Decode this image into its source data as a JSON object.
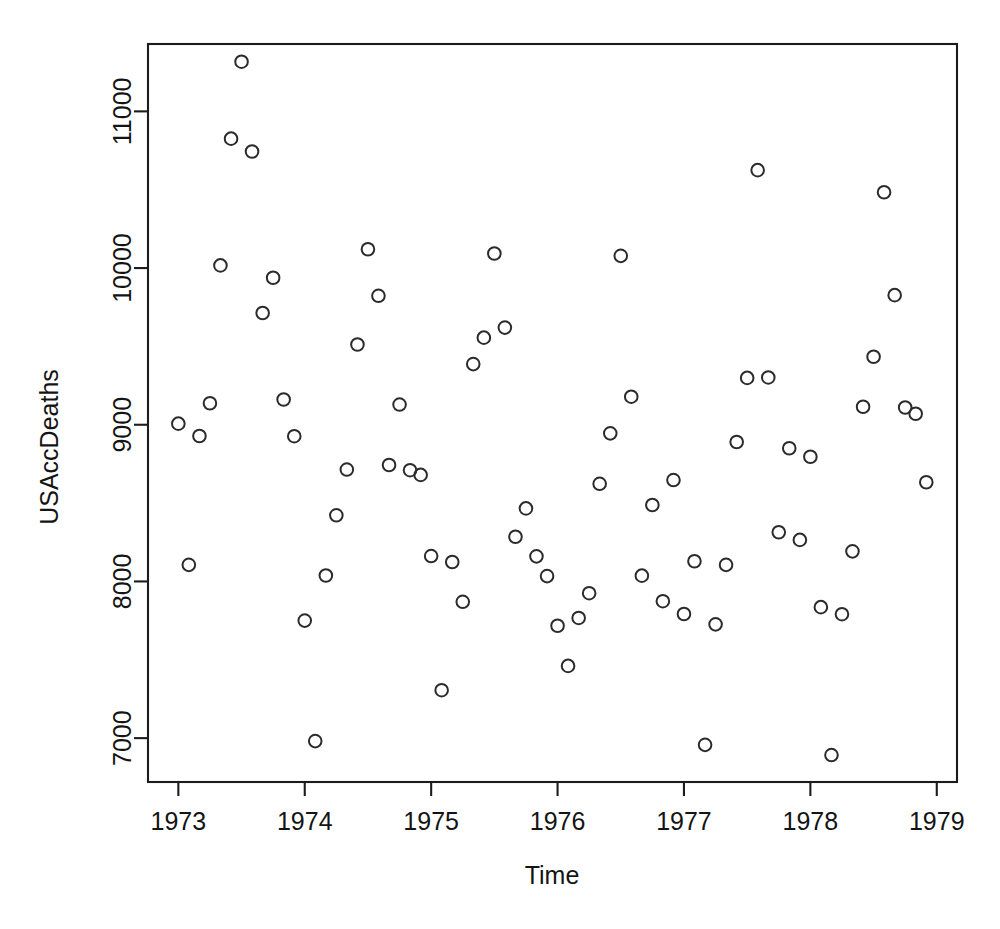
{
  "figure": {
    "background_color": "#ffffff",
    "foreground_color": "#1c1c1c",
    "point_color": "#2b2b2b",
    "x_axis_title": "Time",
    "y_axis_title": "USAccDeaths"
  },
  "chart_data": {
    "type": "scatter",
    "title": "",
    "xlabel": "Time",
    "ylabel": "USAccDeaths",
    "xlim": [
      1972.76,
      1979.16
    ],
    "ylim": [
      6720,
      11430
    ],
    "grid": false,
    "legend": null,
    "marker": "open-circle",
    "x_ticks": [
      1973,
      1974,
      1975,
      1976,
      1977,
      1978,
      1979
    ],
    "x_tick_labels": [
      "1973",
      "1974",
      "1975",
      "1976",
      "1977",
      "1978",
      "1979"
    ],
    "y_ticks": [
      7000,
      8000,
      9000,
      10000,
      11000
    ],
    "y_tick_labels": [
      "7000",
      "8000",
      "9000",
      "10000",
      "11000"
    ],
    "n_points": 72,
    "x": [
      1973.0,
      1973.083,
      1973.167,
      1973.25,
      1973.333,
      1973.417,
      1973.5,
      1973.583,
      1973.667,
      1973.75,
      1973.833,
      1973.917,
      1974.0,
      1974.083,
      1974.167,
      1974.25,
      1974.333,
      1974.417,
      1974.5,
      1974.583,
      1974.667,
      1974.75,
      1974.833,
      1974.917,
      1975.0,
      1975.083,
      1975.167,
      1975.25,
      1975.333,
      1975.417,
      1975.5,
      1975.583,
      1975.667,
      1975.75,
      1975.833,
      1975.917,
      1976.0,
      1976.083,
      1976.167,
      1976.25,
      1976.333,
      1976.417,
      1976.5,
      1976.583,
      1976.667,
      1976.75,
      1976.833,
      1976.917,
      1977.0,
      1977.083,
      1977.167,
      1977.25,
      1977.333,
      1977.417,
      1977.5,
      1977.583,
      1977.667,
      1977.75,
      1977.833,
      1977.917,
      1978.0,
      1978.083,
      1978.167,
      1978.25,
      1978.333,
      1978.417,
      1978.5,
      1978.583,
      1978.667,
      1978.75,
      1978.833,
      1978.917
    ],
    "y": [
      9007,
      8106,
      8928,
      9137,
      10017,
      10826,
      11317,
      10744,
      9713,
      9938,
      9161,
      8927,
      7750,
      6981,
      8038,
      8422,
      8714,
      9512,
      10120,
      9823,
      8743,
      9129,
      8710,
      8680,
      8162,
      7306,
      8124,
      7870,
      9387,
      9556,
      10093,
      9620,
      8285,
      8466,
      8160,
      8034,
      7717,
      7461,
      7767,
      7925,
      8623,
      8945,
      10078,
      9179,
      8037,
      8488,
      7874,
      8647,
      7792,
      8129,
      6957,
      7726,
      8106,
      8890,
      9299,
      10625,
      9302,
      8314,
      8850,
      8265,
      8796,
      7836,
      6892,
      7791,
      8192,
      9115,
      9434,
      10484,
      9827,
      9110,
      9070,
      8633
    ]
  }
}
